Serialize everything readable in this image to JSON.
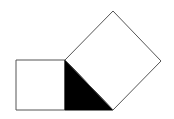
{
  "diagram": {
    "colors": {
      "background": "#ffffff",
      "stroke": "#555555",
      "triangle_fill": "#000000",
      "square_fill": "#ffffff"
    },
    "shapes": {
      "left_square": {
        "points": "16,60 65,60 65,110 16,110"
      },
      "triangle": {
        "points": "65,60 65,110 113,110"
      },
      "rotated_square": {
        "points": "65,60 113,11 161,61 113,110"
      }
    }
  }
}
